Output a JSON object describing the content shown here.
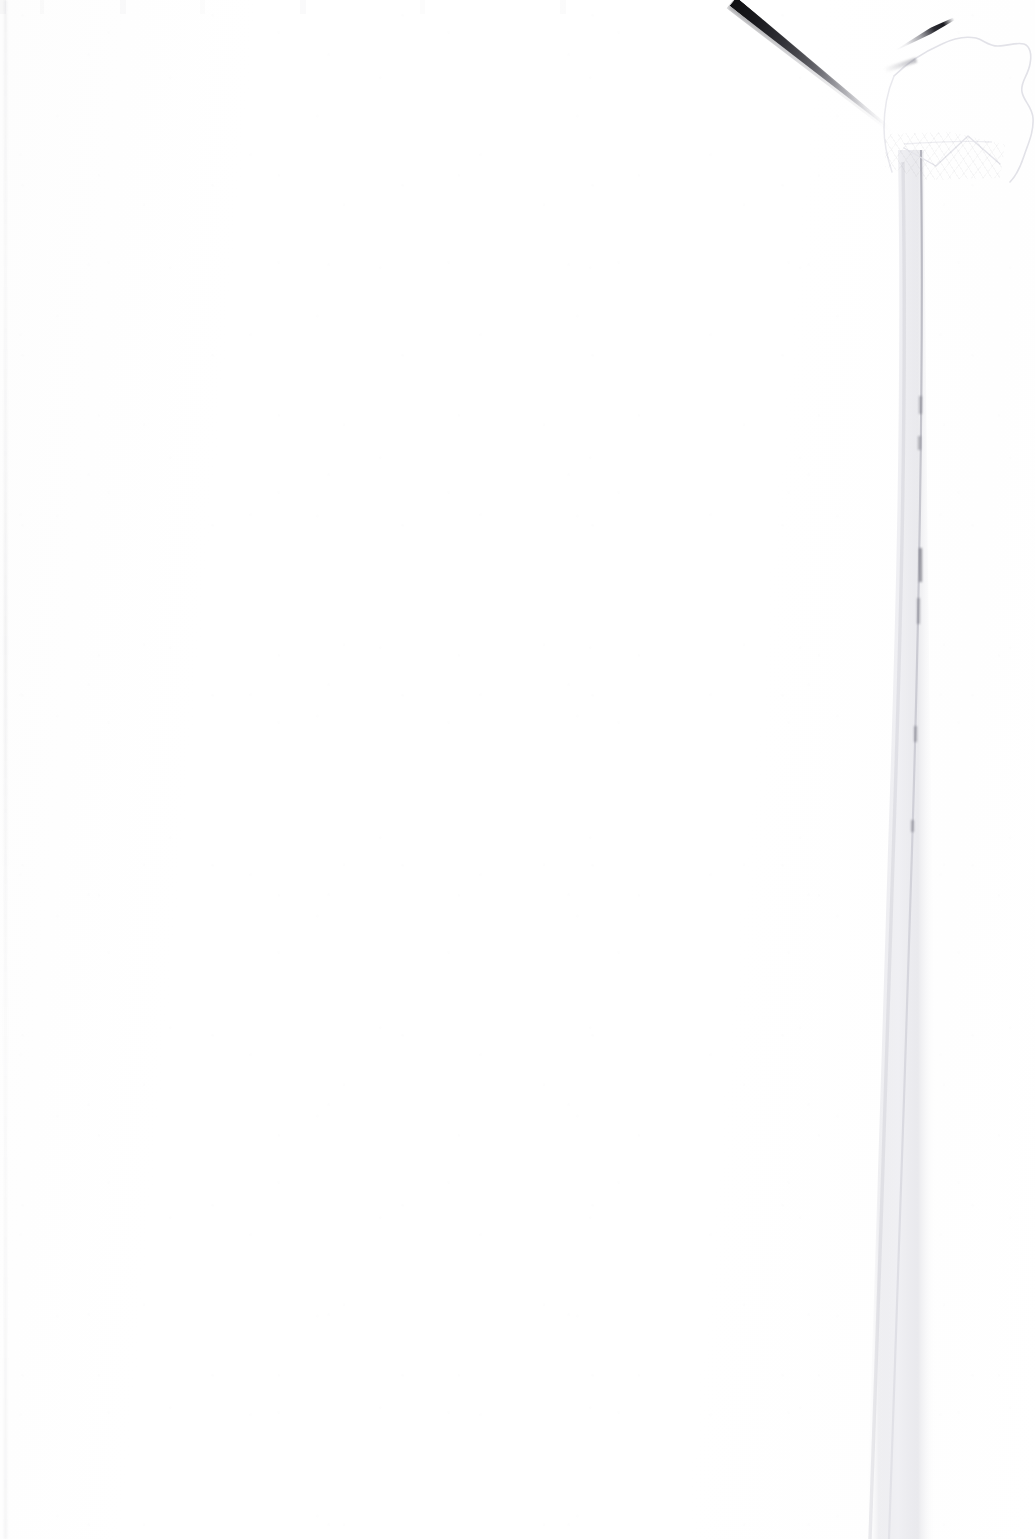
{
  "document": {
    "kind": "scanned-page",
    "page_state": "blank",
    "visible_text": "",
    "width_px": 1035,
    "height_px": 1539,
    "background_color": "#ffffff",
    "paper_tone": "#fdfdfd"
  },
  "artifacts": {
    "scan_streak": {
      "name": "diagonal-scan-streak",
      "color": "#0a0a0c",
      "start_x": 733,
      "start_y": 0,
      "end_x": 888,
      "end_y": 128,
      "angle_deg": 39,
      "max_thickness_px": 11,
      "description": "dark tapering diagonal mark across the upper right"
    },
    "torn_corner": {
      "name": "torn-folded-page-corner",
      "x": 880,
      "y": 24,
      "width": 155,
      "height": 160,
      "outline_color": "#ededf0",
      "crease_color": "#15151a",
      "description": "folded and torn upper-right page corner with a dark crease"
    },
    "page_edge_band": {
      "name": "right-page-edge-shadow",
      "top_x": 920,
      "bottom_x": 880,
      "top_y": 150,
      "bottom_y": 1539,
      "band_width_px": 26,
      "color": "#e8e8ec",
      "description": "faint vertical sheet edge and shadow running down the right side"
    },
    "left_edge": {
      "name": "left-sheet-edge",
      "x": 5,
      "color": "#f2f2f5"
    }
  }
}
